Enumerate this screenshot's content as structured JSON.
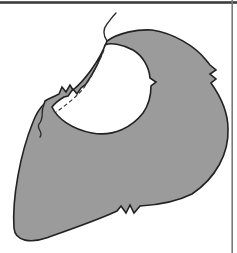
{
  "illustration": {
    "alt": "Sewing-book illustration: grey garment piece with circular neckline opening, narrow faced seam band, dashed understitching line, clipped zigzag notches on the neck band, right edge and lower edge, a V-nick on the neckline, and loose threads hanging at the shoulder point and left neckline point",
    "parts": {
      "garment_piece": "grey fabric piece",
      "neckline_cutout": "circular neckline opening",
      "seam_band": "folded seam-allowance band along upper-left neckline",
      "understitching": "dashed stitching line inside neckline",
      "band_notches": "zigzag clips on neck band",
      "right_edge_notches": "double notch on right edge",
      "bottom_edge_notches": "triple notch on lower edge",
      "neckline_nick": "single V-nick on right of neckline",
      "thread_top": "loose thread at top point",
      "thread_left": "loose thread at left neckline point"
    },
    "colors": {
      "background": "#ffffff",
      "fabric": "#9b9b9b",
      "outline": "#222222",
      "stitching": "#333333",
      "thread": "#2a2a2a",
      "frame_top_rule": "#3d3d3d",
      "frame_right_rule": "#7a7a7a"
    }
  }
}
